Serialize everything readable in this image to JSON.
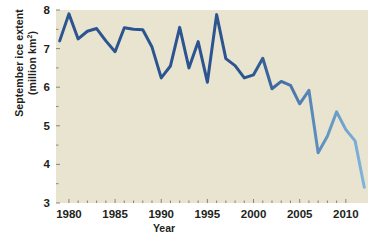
{
  "chart_data": {
    "type": "line",
    "title": "",
    "xlabel": "Year",
    "ylabel_line1": "September ice extent",
    "ylabel_line2": "(million km",
    "ylabel_exponent": "2",
    "ylabel_line2_end": ")",
    "xlim": [
      1978.6,
      2012.4
    ],
    "ylim": [
      3,
      8
    ],
    "grid": false,
    "legend": null,
    "line_color_start": "#2c5490",
    "line_color_end": "#7fb4dc",
    "plot_background": "#e8e4cf",
    "page_background": "#ffffff",
    "xticks": [
      1980,
      1985,
      1990,
      1995,
      2000,
      2005,
      2010
    ],
    "xtick_labels": [
      "1980",
      "1985",
      "1990",
      "1995",
      "2000",
      "2005",
      "2010"
    ],
    "yticks": [
      3,
      4,
      5,
      6,
      7,
      8
    ],
    "ytick_labels": [
      "3",
      "4",
      "5",
      "6",
      "7",
      "8"
    ],
    "x": [
      1979,
      1980,
      1981,
      1982,
      1983,
      1984,
      1985,
      1986,
      1987,
      1988,
      1989,
      1990,
      1991,
      1992,
      1993,
      1994,
      1995,
      1996,
      1997,
      1998,
      1999,
      2000,
      2001,
      2002,
      2003,
      2004,
      2005,
      2006,
      2007,
      2008,
      2009,
      2010,
      2011,
      2012
    ],
    "values": [
      7.2,
      7.9,
      7.25,
      7.45,
      7.52,
      7.2,
      6.92,
      7.54,
      7.5,
      7.49,
      7.04,
      6.24,
      6.55,
      7.55,
      6.5,
      7.18,
      6.13,
      7.88,
      6.74,
      6.56,
      6.24,
      6.32,
      6.75,
      5.96,
      6.15,
      6.05,
      5.57,
      5.92,
      4.3,
      4.73,
      5.36,
      4.9,
      4.61,
      3.41
    ]
  },
  "axis": {
    "tick_color": "#8a8570",
    "label_color": "#231f20"
  }
}
